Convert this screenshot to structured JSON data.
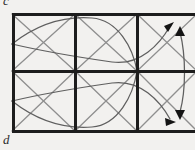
{
  "figure": {
    "label_top": "c",
    "label_bottom": "d",
    "caption_note": "",
    "background_color": "#f2f1ef",
    "grid_stroke_color": "#1a1a1a",
    "diagonal_stroke_color": "#8a8a8a",
    "curve_stroke_color": "#5a5a5a",
    "arrow_fill_color": "#1a1a1a"
  },
  "grid": {
    "columns": 3,
    "rows": 2,
    "left": 12,
    "top": 14,
    "right": 195,
    "bottom": 131,
    "vertical_dividers": [
      75,
      137
    ],
    "horizontal_dividers": [
      71
    ],
    "border_width": 3,
    "divider_width": 3
  },
  "cells": [
    {
      "name": "cell-top-left",
      "col": 0,
      "row": 0,
      "motif": "diagonals"
    },
    {
      "name": "cell-top-middle",
      "col": 1,
      "row": 0,
      "motif": "diagonals"
    },
    {
      "name": "cell-top-right",
      "col": 2,
      "row": 0,
      "motif": "diagonals"
    },
    {
      "name": "cell-bottom-left",
      "col": 0,
      "row": 1,
      "motif": "diagonals"
    },
    {
      "name": "cell-bottom-middle",
      "col": 1,
      "row": 1,
      "motif": "diagonals"
    },
    {
      "name": "cell-bottom-right",
      "col": 2,
      "row": 1,
      "motif": "diagonals"
    }
  ],
  "curves": [
    {
      "name": "curve-upper-left-lobe",
      "arrow": false
    },
    {
      "name": "curve-lower-left-lobe",
      "arrow": false
    },
    {
      "name": "curve-upper-right-lobe",
      "arrow": true,
      "arrow_direction": "up-right"
    },
    {
      "name": "curve-lower-right-lobe",
      "arrow": true,
      "arrow_direction": "right"
    }
  ],
  "arrows": [
    {
      "name": "arrowhead-top-curve",
      "direction": "up-right",
      "x": 172,
      "y": 24
    },
    {
      "name": "arrowhead-top-vertical",
      "direction": "up",
      "x": 180,
      "y": 29
    },
    {
      "name": "arrowhead-bottom-vertical",
      "direction": "down",
      "x": 180,
      "y": 114
    },
    {
      "name": "arrowhead-bottom-curve",
      "direction": "right",
      "x": 172,
      "y": 121
    }
  ]
}
